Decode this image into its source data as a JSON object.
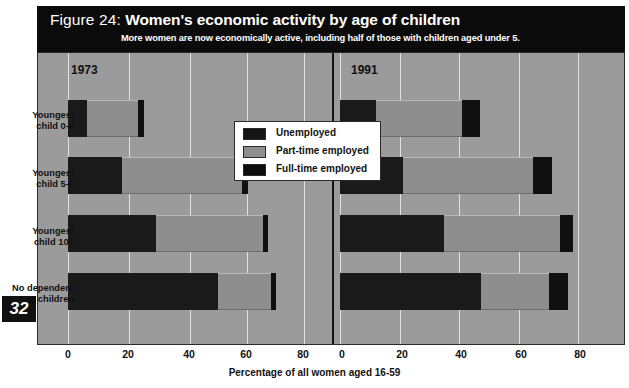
{
  "header": {
    "figure_number": "Figure 24:",
    "title": "Women's economic activity by age of children",
    "subtitle": "More women are now economically active, including half of those with children aged under 5."
  },
  "page_number": "32",
  "legend": {
    "items": [
      {
        "label": "Unemployed",
        "key": "unemployed",
        "color": "#141414"
      },
      {
        "label": "Part-time employed",
        "key": "part",
        "color": "#8e8e8e"
      },
      {
        "label": "Full-time employed",
        "key": "full",
        "color": "#0d0d0d"
      }
    ]
  },
  "panels": [
    {
      "label": "1973"
    },
    {
      "label": "1991"
    }
  ],
  "axis": {
    "ticks": [
      "0",
      "20",
      "40",
      "60",
      "80"
    ],
    "tick_values": [
      0,
      20,
      40,
      60,
      80
    ],
    "title": "Percentage of all women aged 16-59",
    "min": 0,
    "max": 90
  },
  "categories": [
    "Youngest\nchild 0-4",
    "Youngest\nchild 5-9",
    "Youngest\nchild 10+",
    "No dependent\nchildren"
  ],
  "chart_data": {
    "type": "bar",
    "orientation": "horizontal",
    "stacked": true,
    "title": "Women's economic activity by age of children",
    "subtitle": "More women are now economically active, including half of those with children aged under 5.",
    "xlabel": "Percentage of all women aged 16-59",
    "ylabel": "",
    "xlim": [
      0,
      90
    ],
    "grid": true,
    "legend_position": "top-center",
    "categories": [
      "Youngest child 0-4",
      "Youngest child 5-9",
      "Youngest child 10+",
      "No dependent children"
    ],
    "panels": [
      {
        "name": "1973",
        "series": [
          {
            "name": "Unemployed",
            "values": [
              6.5,
              18.5,
              30.0,
              51.0
            ]
          },
          {
            "name": "Part-time employed",
            "values": [
              17.5,
              41.0,
              36.5,
              18.0
            ]
          },
          {
            "name": "Full-time employed",
            "values": [
              2.0,
              2.0,
              1.5,
              1.5
            ]
          }
        ],
        "totals": [
          26.0,
          61.5,
          68.0,
          70.5
        ]
      },
      {
        "name": "1991",
        "series": [
          {
            "name": "Unemployed",
            "values": [
              12.0,
              21.0,
              35.0,
              47.5
            ]
          },
          {
            "name": "Part-time employed",
            "values": [
              29.0,
              44.0,
              39.0,
              23.0
            ]
          },
          {
            "name": "Full-time employed",
            "values": [
              6.0,
              6.5,
              4.5,
              6.5
            ]
          }
        ],
        "totals": [
          47.0,
          71.5,
          78.5,
          77.0
        ]
      }
    ]
  }
}
